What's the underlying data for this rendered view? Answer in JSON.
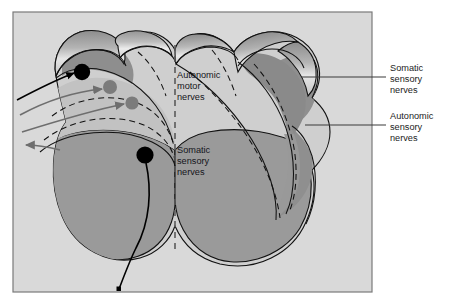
{
  "figure": {
    "panel": {
      "background_color": "#d9d9d9",
      "border_color": "#7a7a7a"
    },
    "colors": {
      "tissue_light": "#cfcfcf",
      "tissue_mid": "#a8a8a8",
      "tissue_dark": "#909090",
      "tissue_darker": "#7e7e7e",
      "outline": "#111111",
      "black_fiber": "#000000",
      "gray_fiber": "#6e6e6e",
      "label_text": "#1c1c1c",
      "leader_line": "#3a3a3a"
    }
  },
  "internal_labels": [
    {
      "id": "autonomic-motor",
      "lines": [
        "Autonomic",
        "motor",
        "nerves"
      ],
      "x": 177,
      "y": 78
    },
    {
      "id": "somatic-sensory-internal",
      "lines": [
        "Somatic",
        "sensory",
        "nerves"
      ],
      "x": 177,
      "y": 153
    }
  ],
  "callout_labels": [
    {
      "id": "somatic-sensory-nerves",
      "lines": [
        "Somatic",
        "sensory",
        "nerves"
      ],
      "x": 390,
      "y": 71,
      "leader": {
        "x1": 302,
        "y1": 77,
        "x2": 386,
        "y2": 77
      }
    },
    {
      "id": "autonomic-sensory-nerves",
      "lines": [
        "Autonomic",
        "sensory",
        "nerves"
      ],
      "x": 390,
      "y": 119,
      "leader": {
        "x1": 305,
        "y1": 125,
        "x2": 386,
        "y2": 125
      }
    }
  ],
  "markers": [
    {
      "id": "black-cell-body-dorsal",
      "type": "black-dot",
      "cx": 82,
      "cy": 72,
      "r": 8.2
    },
    {
      "id": "gray-cell-body-upper",
      "type": "gray-dot",
      "cx": 110,
      "cy": 87,
      "r": 7.0
    },
    {
      "id": "gray-cell-body-lower",
      "type": "gray-dot",
      "cx": 132,
      "cy": 103,
      "r": 6.6
    },
    {
      "id": "black-cell-body-ventral",
      "type": "black-dot",
      "cx": 145,
      "cy": 155,
      "r": 8.6
    }
  ],
  "fibers": [
    {
      "id": "black-afferent-inbound",
      "color": "#000000",
      "arrow": "right"
    },
    {
      "id": "gray-efferent-upper",
      "color": "#6e6e6e",
      "arrow": "right"
    },
    {
      "id": "gray-efferent-lower",
      "color": "#6e6e6e",
      "arrow": "right"
    },
    {
      "id": "gray-efferent-outbound",
      "color": "#6e6e6e",
      "arrow": "left"
    },
    {
      "id": "black-ventral-root",
      "color": "#000000",
      "arrow": "none"
    }
  ],
  "midline": {
    "id": "dashed-midline",
    "x": 175,
    "y1": 45,
    "y2": 252,
    "style": "dashed"
  }
}
